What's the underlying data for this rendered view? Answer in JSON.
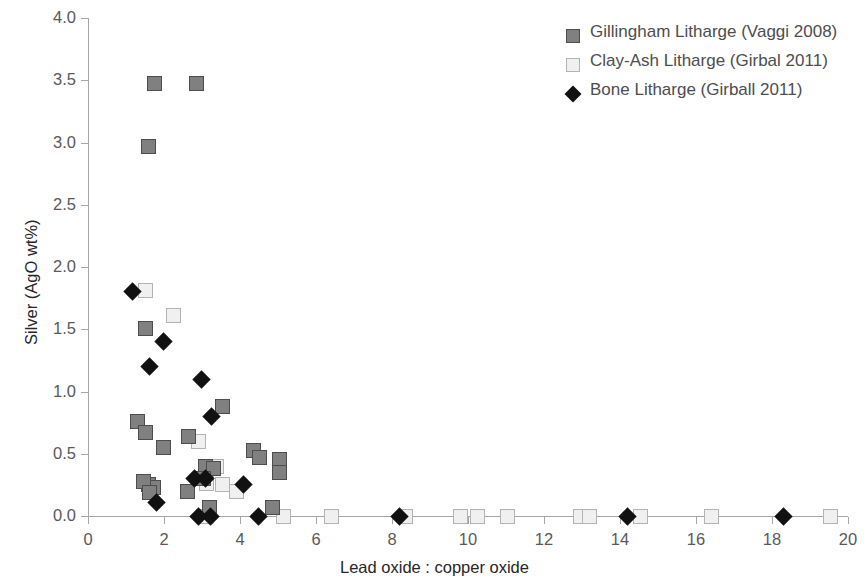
{
  "chart_data": {
    "type": "scatter",
    "title": "",
    "xlabel": "Lead oxide : copper oxide",
    "ylabel": "Silver (AgO wt%)",
    "xlim": [
      0,
      20
    ],
    "ylim": [
      0,
      4.0
    ],
    "xticks": [
      "0",
      "2",
      "4",
      "6",
      "8",
      "10",
      "12",
      "14",
      "16",
      "18",
      "20"
    ],
    "xtick_values": [
      0,
      2,
      4,
      6,
      8,
      10,
      12,
      14,
      16,
      18,
      20
    ],
    "yticks": [
      "0.0",
      "0.5",
      "1.0",
      "1.5",
      "2.0",
      "2.5",
      "3.0",
      "3.5",
      "4.0"
    ],
    "ytick_values": [
      0.0,
      0.5,
      1.0,
      1.5,
      2.0,
      2.5,
      3.0,
      3.5,
      4.0
    ],
    "grid": false,
    "legend_position": "top-right",
    "series": [
      {
        "name": "Gillingham Litharge (Vaggi 2008)",
        "marker": "filled-square",
        "color": "#808080",
        "points": [
          [
            1.75,
            3.47
          ],
          [
            2.85,
            3.47
          ],
          [
            1.6,
            2.97
          ],
          [
            1.5,
            1.51
          ],
          [
            1.3,
            0.76
          ],
          [
            1.5,
            0.67
          ],
          [
            1.98,
            0.55
          ],
          [
            2.65,
            0.64
          ],
          [
            3.55,
            0.88
          ],
          [
            1.6,
            0.25
          ],
          [
            1.72,
            0.23
          ],
          [
            1.45,
            0.28
          ],
          [
            1.62,
            0.19
          ],
          [
            3.1,
            0.4
          ],
          [
            3.3,
            0.38
          ],
          [
            3.05,
            0.3
          ],
          [
            2.62,
            0.2
          ],
          [
            4.35,
            0.53
          ],
          [
            4.5,
            0.47
          ],
          [
            5.05,
            0.45
          ],
          [
            5.05,
            0.35
          ],
          [
            3.2,
            0.07
          ],
          [
            4.85,
            0.07
          ]
        ]
      },
      {
        "name": "Clay-Ash Litharge (Girbal 2011)",
        "marker": "open-square",
        "color": "#f0f0f0",
        "points": [
          [
            1.52,
            1.81
          ],
          [
            2.25,
            1.61
          ],
          [
            2.9,
            0.6
          ],
          [
            3.38,
            0.4
          ],
          [
            3.12,
            0.26
          ],
          [
            3.55,
            0.25
          ],
          [
            3.92,
            0.2
          ],
          [
            3.05,
            0.0
          ],
          [
            5.15,
            0.0
          ],
          [
            6.4,
            0.0
          ],
          [
            8.35,
            0.0
          ],
          [
            9.8,
            0.0
          ],
          [
            10.25,
            0.0
          ],
          [
            11.05,
            0.0
          ],
          [
            12.95,
            0.0
          ],
          [
            13.2,
            0.0
          ],
          [
            14.55,
            0.0
          ],
          [
            16.4,
            0.0
          ],
          [
            19.55,
            0.0
          ]
        ]
      },
      {
        "name": "Bone Litharge (Girball 2011)",
        "marker": "filled-diamond",
        "color": "#111111",
        "points": [
          [
            1.18,
            1.8
          ],
          [
            1.98,
            1.4
          ],
          [
            1.62,
            1.2
          ],
          [
            2.98,
            1.1
          ],
          [
            3.25,
            0.8
          ],
          [
            2.8,
            0.3
          ],
          [
            3.1,
            0.3
          ],
          [
            4.1,
            0.25
          ],
          [
            1.8,
            0.11
          ],
          [
            2.9,
            0.0
          ],
          [
            3.22,
            0.0
          ],
          [
            4.48,
            0.0
          ],
          [
            8.2,
            0.0
          ],
          [
            14.2,
            0.0
          ],
          [
            18.3,
            0.0
          ]
        ]
      }
    ]
  },
  "legend": {
    "items": [
      {
        "label": "Gillingham Litharge (Vaggi 2008)",
        "marker": "filled-square"
      },
      {
        "label": "Clay-Ash Litharge (Girbal 2011)",
        "marker": "open-square"
      },
      {
        "label": "Bone Litharge (Girball 2011)",
        "marker": "filled-diamond"
      }
    ]
  },
  "axes": {
    "x_title": "Lead oxide : copper oxide",
    "y_title": "Silver (AgO wt%)"
  },
  "colors": {
    "axis": "#a6a6a6",
    "tick_text": "#595959",
    "axis_title": "#262626",
    "series_dark": "#808080",
    "series_light": "#f0f0f0",
    "series_black": "#111111"
  }
}
